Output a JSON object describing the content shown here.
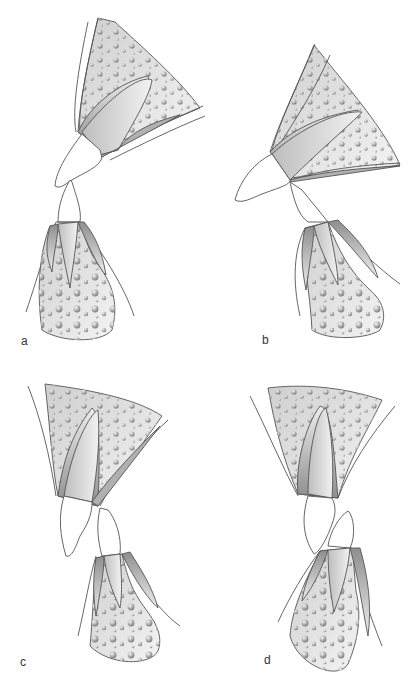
{
  "figure": {
    "panels": [
      {
        "id": "a",
        "label": "a",
        "description": "Proclined upper incisor; lower incisor upright, edge-to-edge contact near incisal tips"
      },
      {
        "id": "b",
        "label": "b",
        "description": "Strongly proclined upper incisor with increased overjet; lower incisor inclined"
      },
      {
        "id": "c",
        "label": "c",
        "description": "Upright upper incisor; lower incisor positioned behind and below"
      },
      {
        "id": "d",
        "label": "d",
        "description": "Upright upper incisor; proclined lower incisor crown tipping forward"
      }
    ]
  },
  "colors": {
    "outline": "#555555",
    "bone_light": "#f2f2f2",
    "bone_dark": "#9a9a9a",
    "cortex_dark": "#8c8c8c",
    "crown": "#ffffff",
    "label": "#333333"
  }
}
